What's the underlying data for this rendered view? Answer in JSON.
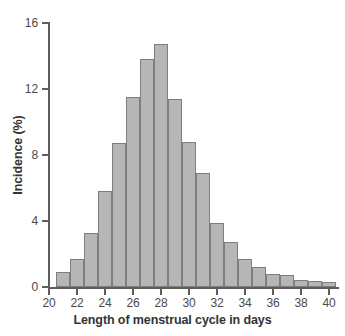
{
  "chart_data": {
    "type": "bar",
    "title": "",
    "subtitle": "",
    "xlabel": "Length of menstrual cycle in days",
    "ylabel": "Incidence (%)",
    "xlim": [
      20,
      41
    ],
    "ylim": [
      0,
      16
    ],
    "grid": false,
    "legend": null,
    "bin_width": 1,
    "bar_fill_color": "#b6b6b6",
    "bar_edge_color": "#7e7e7e",
    "axis_color": "#5d5d5d",
    "background_color": "#ffffff",
    "x_tick_labels": [
      "20",
      "22",
      "24",
      "26",
      "28",
      "30",
      "32",
      "34",
      "36",
      "38",
      "40"
    ],
    "x_tick_values": [
      20,
      22,
      24,
      26,
      28,
      30,
      32,
      34,
      36,
      38,
      40
    ],
    "y_tick_labels": [
      "0",
      "4",
      "8",
      "12",
      "16"
    ],
    "y_tick_values": [
      0,
      4,
      8,
      12,
      16
    ],
    "categories": [
      "20.5-21.5",
      "21.5-22.5",
      "22.5-23.5",
      "23.5-24.5",
      "24.5-25.5",
      "25.5-26.5",
      "26.5-27.5",
      "27.5-28.5",
      "28.5-29.5",
      "29.5-30.5",
      "30.5-31.5",
      "31.5-32.5",
      "32.5-33.5",
      "33.5-34.5",
      "34.5-35.5",
      "35.5-36.5",
      "36.5-37.5",
      "37.5-38.5",
      "38.5-39.5",
      "39.5-40.5"
    ],
    "bin_starts": [
      20.5,
      21.5,
      22.5,
      23.5,
      24.5,
      25.5,
      26.5,
      27.5,
      28.5,
      29.5,
      30.5,
      31.5,
      32.5,
      33.5,
      34.5,
      35.5,
      36.5,
      37.5,
      38.5,
      39.5
    ],
    "values": [
      0.9,
      1.7,
      3.3,
      5.8,
      8.7,
      11.5,
      13.8,
      14.7,
      11.4,
      8.8,
      6.9,
      3.9,
      2.7,
      1.7,
      1.2,
      0.8,
      0.75,
      0.4,
      0.35,
      0.3
    ]
  }
}
